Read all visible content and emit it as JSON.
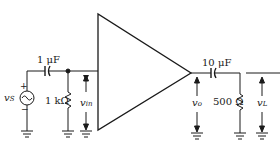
{
  "diagram": {
    "type": "amplifier-circuit",
    "amplifier": {
      "symbol": "triangle"
    },
    "input": {
      "source": {
        "label": "v",
        "subscript": "S",
        "plus": "+",
        "minus": "−"
      },
      "coupling_capacitor": {
        "label": "1 μF"
      },
      "resistor": {
        "label": "1 kΩ"
      },
      "voltage": {
        "label": "v",
        "subscript": "in"
      }
    },
    "output": {
      "voltage_o": {
        "label": "v",
        "subscript": "o"
      },
      "coupling_capacitor": {
        "label": "10 μF"
      },
      "load_resistor": {
        "label": "500 Ω"
      },
      "voltage_load": {
        "label": "v",
        "subscript": "L"
      }
    },
    "colors": {
      "line": "#1a1a1a",
      "background": "#ffffff"
    }
  }
}
